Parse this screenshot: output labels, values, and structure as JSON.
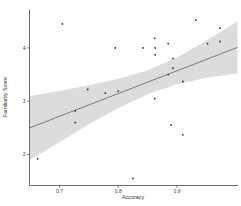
{
  "figure": {
    "title": ""
  },
  "chart_data": {
    "type": "scatter",
    "title": "",
    "xlabel": "Accuracy",
    "ylabel": "Familiarity Score",
    "xlim": [
      0.649,
      1.003
    ],
    "ylim": [
      1.42,
      4.72
    ],
    "x_ticks": [
      0.7,
      0.8,
      0.9
    ],
    "x_tick_labels": [
      "0.7",
      "0.8",
      "0.9"
    ],
    "y_ticks": [
      2,
      3,
      4
    ],
    "y_tick_labels": [
      "2",
      "3",
      "4"
    ],
    "grid": false,
    "legend": null,
    "points": [
      [
        0.705,
        4.45
      ],
      [
        0.795,
        4.0
      ],
      [
        0.842,
        4.0
      ],
      [
        0.862,
        4.18
      ],
      [
        0.863,
        4.0
      ],
      [
        0.863,
        3.87
      ],
      [
        0.885,
        4.08
      ],
      [
        0.932,
        4.52
      ],
      [
        0.973,
        4.37
      ],
      [
        0.952,
        4.08
      ],
      [
        0.973,
        4.12
      ],
      [
        0.893,
        3.8
      ],
      [
        0.893,
        3.62
      ],
      [
        0.885,
        3.5
      ],
      [
        0.91,
        3.37
      ],
      [
        0.862,
        3.05
      ],
      [
        0.748,
        3.22
      ],
      [
        0.778,
        3.15
      ],
      [
        0.8,
        3.19
      ],
      [
        0.727,
        2.82
      ],
      [
        0.727,
        2.6
      ],
      [
        0.663,
        1.92
      ],
      [
        0.825,
        1.55
      ],
      [
        0.89,
        2.55
      ],
      [
        0.91,
        2.37
      ]
    ],
    "regression_line": {
      "x": [
        0.649,
        1.003
      ],
      "y": [
        2.5,
        4.01
      ]
    },
    "confidence_band": {
      "x": [
        0.649,
        0.7,
        0.75,
        0.8,
        0.85,
        0.9,
        0.95,
        1.003
      ],
      "upper": [
        3.1,
        3.19,
        3.3,
        3.42,
        3.58,
        3.82,
        4.14,
        4.5
      ],
      "lower": [
        1.9,
        2.23,
        2.57,
        2.87,
        3.13,
        3.32,
        3.44,
        3.52
      ]
    },
    "colors": {
      "point": "#2b2b2b",
      "line": "#6e6e6e",
      "band": "#dcdcdc",
      "axis": "#4a4a4a",
      "tick_label": "#3a3a3a"
    }
  }
}
